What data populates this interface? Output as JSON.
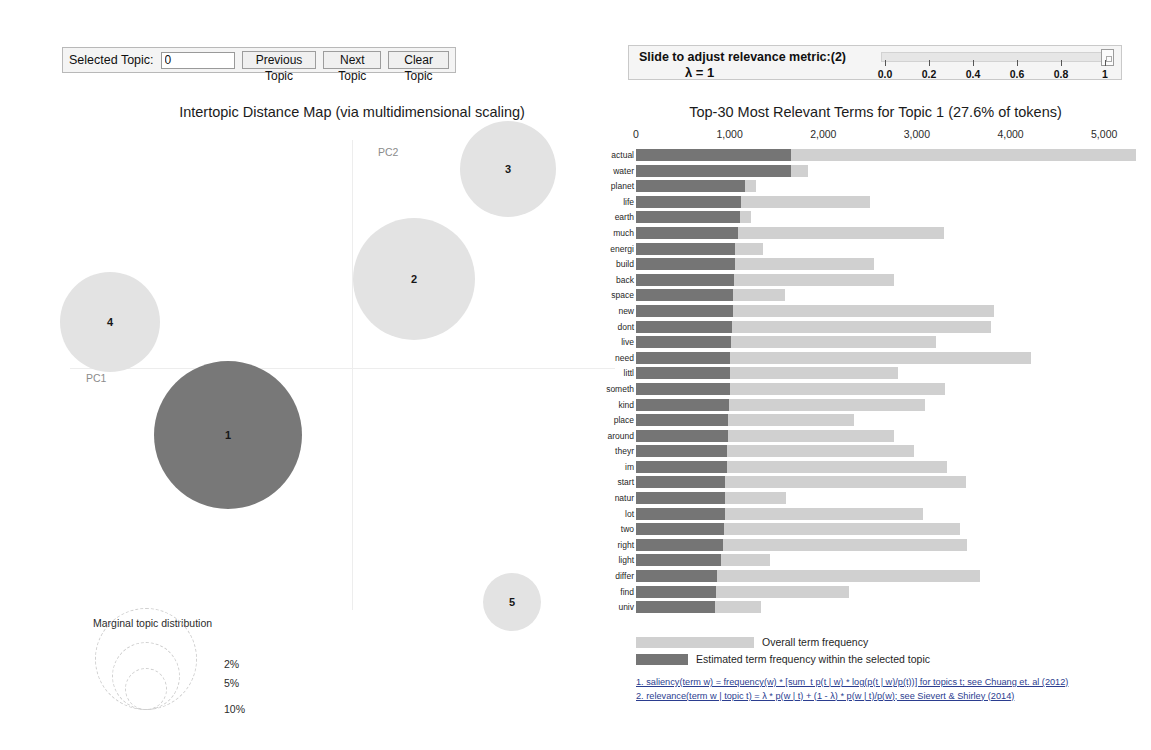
{
  "topic_controls": {
    "label": "Selected Topic:",
    "selected_topic_value": "0",
    "previous_label": "Previous Topic",
    "next_label": "Next Topic",
    "clear_label": "Clear Topic"
  },
  "lambda_controls": {
    "label": "Slide to adjust relevance metric:(2)",
    "lambda_display": "λ = 1",
    "slider_value": 1,
    "ticks": [
      "0.0",
      "0.2",
      "0.4",
      "0.6",
      "0.8",
      "1"
    ]
  },
  "map": {
    "title": "Intertopic Distance Map (via multidimensional scaling)",
    "pc1_label": "PC1",
    "pc2_label": "PC2",
    "marginal_title": "Marginal topic distribution",
    "marginal_ticks": [
      "2%",
      "5%",
      "10%"
    ],
    "topics": [
      {
        "id": "1",
        "cx": 228,
        "cy": 435,
        "r": 74,
        "selected": true
      },
      {
        "id": "2",
        "cx": 414,
        "cy": 279,
        "r": 61,
        "selected": false
      },
      {
        "id": "3",
        "cx": 508,
        "cy": 169,
        "r": 48,
        "selected": false
      },
      {
        "id": "4",
        "cx": 110,
        "cy": 322,
        "r": 50,
        "selected": false
      },
      {
        "id": "5",
        "cx": 512,
        "cy": 602,
        "r": 29,
        "selected": false
      }
    ],
    "colors": {
      "selected": "#787878",
      "unselected": "#e3e3e3"
    }
  },
  "barchart": {
    "title": "Top-30 Most Relevant Terms for Topic 1 (27.6% of tokens)",
    "legend": [
      {
        "swatch": "#d0d0d0",
        "label": "Overall term frequency",
        "width": 118
      },
      {
        "swatch": "#757575",
        "label": "Estimated term frequency within the selected topic",
        "width": 52
      }
    ],
    "footnotes": [
      "1. saliency(term w) = frequency(w) * [sum_t p(t | w) * log(p(t | w)/p(t))] for topics t; see Chuang et. al (2012)",
      "2. relevance(term w | topic t) = λ * p(w | t) + (1 - λ) * p(w | t)/p(w); see Sievert & Shirley (2014)"
    ]
  },
  "chart_data": {
    "type": "bar",
    "title": "Top-30 Most Relevant Terms for Topic 1 (27.6% of tokens)",
    "xlabel": "",
    "ylabel": "",
    "xlim": [
      0,
      5500
    ],
    "xticks": [
      0,
      1000,
      2000,
      3000,
      4000,
      5000
    ],
    "xticklabels": [
      "0",
      "1,000",
      "2,000",
      "3,000",
      "4,000",
      "5,000"
    ],
    "grid": false,
    "legend_position": "bottom",
    "categories": [
      "actual",
      "water",
      "planet",
      "life",
      "earth",
      "much",
      "energi",
      "build",
      "back",
      "space",
      "new",
      "dont",
      "live",
      "need",
      "littl",
      "someth",
      "kind",
      "place",
      "around",
      "theyr",
      "im",
      "start",
      "natur",
      "lot",
      "two",
      "right",
      "light",
      "differ",
      "find",
      "univ"
    ],
    "series": [
      {
        "name": "Overall term frequency",
        "color": "#d0d0d0",
        "values": [
          5345,
          1840,
          1280,
          2500,
          1230,
          3290,
          1360,
          2540,
          2750,
          1590,
          3820,
          3790,
          3200,
          4220,
          2800,
          3300,
          3090,
          2330,
          2760,
          2970,
          3320,
          3520,
          1600,
          3070,
          3460,
          3530,
          1430,
          3670,
          2270,
          1330
        ]
      },
      {
        "name": "Estimated term frequency within the selected topic",
        "color": "#757575",
        "values": [
          1650,
          1650,
          1160,
          1120,
          1110,
          1090,
          1060,
          1060,
          1050,
          1040,
          1040,
          1020,
          1015,
          1005,
          1000,
          1000,
          995,
          985,
          985,
          975,
          975,
          955,
          950,
          950,
          945,
          930,
          910,
          870,
          850,
          845
        ]
      }
    ]
  }
}
